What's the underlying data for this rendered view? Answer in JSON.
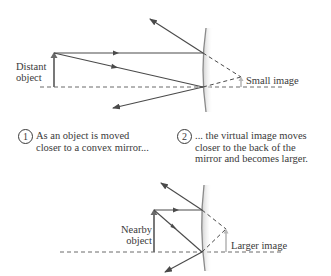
{
  "top_diagram": {
    "object_label_line1": "Distant",
    "object_label_line2": "object",
    "image_label": "Small image"
  },
  "captions": [
    {
      "number": "1",
      "text": "As an object is moved\ncloser to a convex mirror..."
    },
    {
      "number": "2",
      "text": "... the virtual image moves\ncloser to the back of the\nmirror and becomes larger."
    }
  ],
  "bottom_diagram": {
    "object_label_line1": "Nearby",
    "object_label_line2": "object",
    "image_label": "Larger image"
  },
  "colors": {
    "ray": "#4a4a4a",
    "object_arrow": "#6a6a6a",
    "image_arrow": "#b8b8b8",
    "mirror": "#8a8a8a",
    "mirror_shade": "#d8d8d8"
  }
}
